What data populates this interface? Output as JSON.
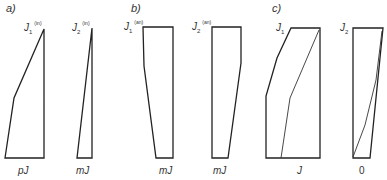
{
  "panels": [
    {
      "label": "a)",
      "diagrams": [
        {
          "symbol": "J",
          "sub": "1",
          "sup": "(in)",
          "bottom_label": "pJ"
        },
        {
          "symbol": "J",
          "sub": "2",
          "sup": "(in)",
          "bottom_label": "mJ"
        }
      ]
    },
    {
      "label": "b)",
      "diagrams": [
        {
          "symbol": "J",
          "sub": "1",
          "sup": "(an)",
          "bottom_label": "mJ"
        },
        {
          "symbol": "J",
          "sub": "2",
          "sup": "(an)",
          "bottom_label": "mJ"
        }
      ]
    },
    {
      "label": "c)",
      "diagrams": [
        {
          "symbol": "J",
          "sub": "1",
          "sup": "",
          "bottom_label": "J"
        },
        {
          "symbol": "J",
          "sub": "2",
          "sup": "",
          "bottom_label": "0"
        }
      ]
    }
  ],
  "colors": {
    "stroke": "#222222",
    "text": "#333333"
  }
}
